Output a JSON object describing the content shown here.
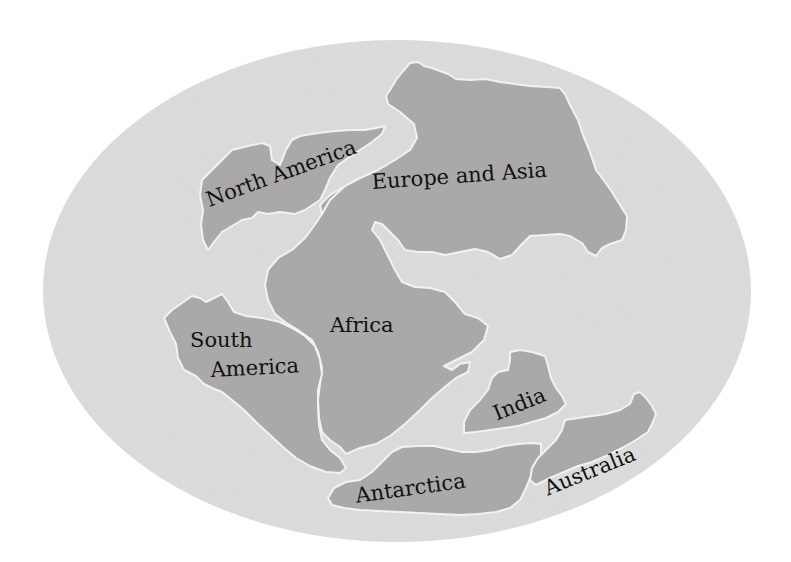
{
  "map": {
    "background_color": "#ffffff",
    "ocean_color": "#dcdcdc",
    "land_color": "#a9a9a9",
    "coast_color": "#f2f2f2",
    "label_color": "#111111",
    "globe": {
      "cx": 397,
      "cy": 291,
      "rx": 354,
      "ry": 251
    }
  },
  "landmasses": [
    {
      "id": "north-america",
      "label": "North America"
    },
    {
      "id": "europe-and-asia",
      "label": "Europe and Asia"
    },
    {
      "id": "africa",
      "label": "Africa"
    },
    {
      "id": "south-america",
      "label_line1": "South",
      "label_line2": "America"
    },
    {
      "id": "india",
      "label": "India"
    },
    {
      "id": "antarctica",
      "label": "Antarctica"
    },
    {
      "id": "australia",
      "label": "Australia"
    }
  ]
}
